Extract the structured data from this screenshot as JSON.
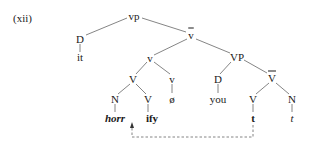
{
  "example_label": "(xii)",
  "nodes": {
    "vp": "vp",
    "D1": "D",
    "it": "it",
    "vbar": "v",
    "v_small": "v",
    "VP": "VP",
    "V_mid": "V",
    "v_null": "v",
    "D2": "D",
    "Vbar": "V",
    "N1": "N",
    "V_ify": "V",
    "null": "ø",
    "you": "you",
    "V_t": "V",
    "N_t": "N",
    "horr": "horr",
    "ify": "ify",
    "t_bold": "t",
    "t_ital": "t"
  },
  "colors": {
    "line": "#555555",
    "text": "#1a1a1a"
  }
}
